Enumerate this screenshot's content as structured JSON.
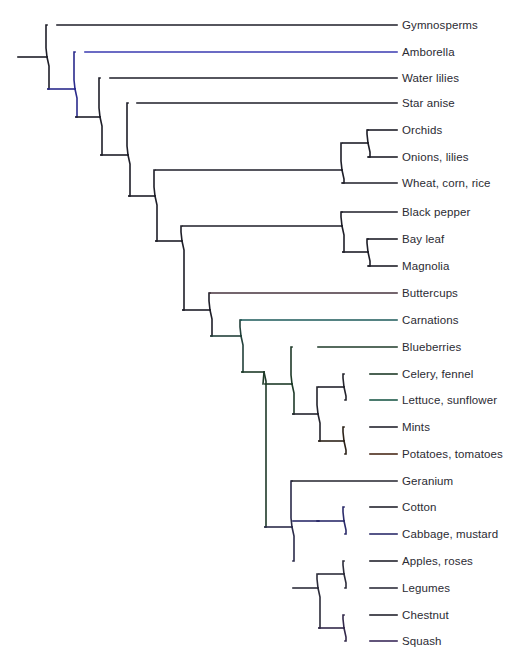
{
  "figure": {
    "name": "plant-phylogeny-cladogram",
    "type": "phylogenetic-tree",
    "background_color": "#ffffff",
    "label_color": "#2b2b33",
    "default_branch_color": "#1a1a22",
    "label_x": 402,
    "tip_x": 397,
    "root_x": 18,
    "root_y": 57
  },
  "tips": [
    {
      "id": "gymnosperms",
      "label": "Gymnosperms",
      "y": 25,
      "branch_x": 57,
      "color": "#1e1e28"
    },
    {
      "id": "amborella",
      "label": "Amborella",
      "y": 52,
      "branch_x": 85,
      "color": "#3a3ab0"
    },
    {
      "id": "water-lilies",
      "label": "Water lilies",
      "y": 78,
      "branch_x": 110,
      "color": "#1e1e28"
    },
    {
      "id": "star-anise",
      "label": "Star anise",
      "y": 103,
      "branch_x": 137,
      "color": "#1e1e28"
    },
    {
      "id": "orchids",
      "label": "Orchids",
      "y": 130,
      "branch_x": 368,
      "color": "#1e1e28"
    },
    {
      "id": "onions-lilies",
      "label": "Onions, lilies",
      "y": 157,
      "branch_x": 368,
      "color": "#1e1e28"
    },
    {
      "id": "wheat-corn-rice",
      "label": "Wheat, corn, rice",
      "y": 183,
      "branch_x": 342,
      "color": "#1e1e28"
    },
    {
      "id": "black-pepper",
      "label": "Black pepper",
      "y": 212,
      "branch_x": 342,
      "color": "#1e1e28"
    },
    {
      "id": "bay-leaf",
      "label": "Bay leaf",
      "y": 239,
      "branch_x": 368,
      "color": "#1e1e28"
    },
    {
      "id": "magnolia",
      "label": "Magnolia",
      "y": 266,
      "branch_x": 368,
      "color": "#1e1e28"
    },
    {
      "id": "buttercups",
      "label": "Buttercups",
      "y": 293,
      "branch_x": 210,
      "color": "#46323c"
    },
    {
      "id": "carnations",
      "label": "Carnations",
      "y": 320,
      "branch_x": 241,
      "color": "#1d5a5a"
    },
    {
      "id": "blueberries",
      "label": "Blueberries",
      "y": 347,
      "branch_x": 318,
      "color": "#1e3a28"
    },
    {
      "id": "celery-fennel",
      "label": "Celery, fennel",
      "y": 374,
      "branch_x": 370,
      "color": "#1e3a28"
    },
    {
      "id": "lettuce-sunflower",
      "label": "Lettuce, sunflower",
      "y": 400,
      "branch_x": 370,
      "color": "#1d5a4a"
    },
    {
      "id": "mints",
      "label": "Mints",
      "y": 427,
      "branch_x": 370,
      "color": "#23232c"
    },
    {
      "id": "potatoes-tomatoes",
      "label": "Potatoes, tomatoes",
      "y": 454,
      "branch_x": 370,
      "color": "#4a2a18"
    },
    {
      "id": "geranium",
      "label": "Geranium",
      "y": 481,
      "branch_x": 292,
      "color": "#23232c"
    },
    {
      "id": "cotton",
      "label": "Cotton",
      "y": 507,
      "branch_x": 370,
      "color": "#23232c"
    },
    {
      "id": "cabbage-mustard",
      "label": "Cabbage, mustard",
      "y": 534,
      "branch_x": 370,
      "color": "#2b2b6a"
    },
    {
      "id": "apples-roses",
      "label": "Apples, roses",
      "y": 561,
      "branch_x": 370,
      "color": "#23232c"
    },
    {
      "id": "legumes",
      "label": "Legumes",
      "y": 588,
      "branch_x": 370,
      "color": "#2c2c3a"
    },
    {
      "id": "chestnut",
      "label": "Chestnut",
      "y": 615,
      "branch_x": 370,
      "color": "#23232c"
    },
    {
      "id": "squash",
      "label": "Squash",
      "y": 641,
      "branch_x": 370,
      "color": "#3a2a5a"
    }
  ],
  "nodes": [
    {
      "id": "root",
      "x": 47,
      "y": 57,
      "child_top_y": 25,
      "child_bot_y": 89,
      "color": "#1e1e28"
    },
    {
      "id": "angiosperms",
      "x": 75,
      "y": 89,
      "child_top_y": 52,
      "child_bot_y": 117,
      "color": "#2b2b8c"
    },
    {
      "id": "mesangiosperms",
      "x": 100,
      "y": 117,
      "child_top_y": 78,
      "child_bot_y": 155,
      "color": "#1e1e28"
    },
    {
      "id": "post-starAnise",
      "x": 128,
      "y": 155,
      "child_top_y": 103,
      "child_bot_y": 196,
      "color": "#1e1e28"
    },
    {
      "id": "monocots",
      "x": 342,
      "y": 170,
      "child_top_y": 143,
      "child_bot_y": 183,
      "color": "#1e1e28"
    },
    {
      "id": "orchid-onion",
      "x": 368,
      "y": 143,
      "child_top_y": 130,
      "child_bot_y": 157,
      "color": "#1e1e28"
    },
    {
      "id": "mono-magno",
      "x": 155,
      "y": 196,
      "child_top_y": 170,
      "child_bot_y": 241,
      "color": "#1e1e28"
    },
    {
      "id": "magnoliids",
      "x": 342,
      "y": 226,
      "child_top_y": 212,
      "child_bot_y": 252,
      "color": "#1e1e28"
    },
    {
      "id": "bay-magnolia",
      "x": 368,
      "y": 252,
      "child_top_y": 239,
      "child_bot_y": 266,
      "color": "#1e1e28"
    },
    {
      "id": "eudicot-stem",
      "x": 182,
      "y": 241,
      "child_top_y": 226,
      "child_bot_y": 310,
      "color": "#1e1e28"
    },
    {
      "id": "eudicots",
      "x": 210,
      "y": 310,
      "child_top_y": 293,
      "child_bot_y": 336,
      "color": "#1e1e28"
    },
    {
      "id": "core-eudicots",
      "x": 241,
      "y": 336,
      "child_top_y": 320,
      "child_bot_y": 372,
      "color": "#22403a"
    },
    {
      "id": "aster-rosid",
      "x": 264,
      "y": 372,
      "child_top_y": 384,
      "child_bot_y": 527,
      "color": "#1e3a28"
    },
    {
      "id": "asterids",
      "x": 292,
      "y": 384,
      "child_top_y": 347,
      "child_bot_y": 414,
      "color": "#1e3a28"
    },
    {
      "id": "asterid-core",
      "x": 318,
      "y": 414,
      "child_top_y": 387,
      "child_bot_y": 441,
      "color": "#23232c"
    },
    {
      "id": "celery-lettuce",
      "x": 344,
      "y": 387,
      "child_top_y": 374,
      "child_bot_y": 400,
      "color": "#23232c"
    },
    {
      "id": "mint-potato",
      "x": 344,
      "y": 441,
      "child_top_y": 427,
      "child_bot_y": 454,
      "color": "#2c2218"
    },
    {
      "id": "rosids",
      "x": 292,
      "y": 527,
      "child_top_y": 481,
      "child_bot_y": 561,
      "color": "#2b2b4a"
    },
    {
      "id": "malvid-brassic",
      "x": 318,
      "y": 521,
      "child_top_y": 521,
      "child_bot_y": 521,
      "color": "#2b2b6a"
    },
    {
      "id": "cotton-cabbage",
      "x": 344,
      "y": 521,
      "child_top_y": 507,
      "child_bot_y": 534,
      "color": "#2b2b6a"
    },
    {
      "id": "fabids",
      "x": 318,
      "y": 588,
      "child_top_y": 574,
      "child_bot_y": 628,
      "color": "#2c2c3a"
    },
    {
      "id": "apple-legume",
      "x": 344,
      "y": 574,
      "child_top_y": 561,
      "child_bot_y": 588,
      "color": "#2c2c3a"
    },
    {
      "id": "chestnut-squash",
      "x": 344,
      "y": 628,
      "child_top_y": 615,
      "child_bot_y": 641,
      "color": "#32284a"
    }
  ],
  "clades": [
    {
      "id": "root",
      "label": "seed plants"
    },
    {
      "id": "angiosperms",
      "label": "angiosperms"
    },
    {
      "id": "monocots",
      "label": "monocots"
    },
    {
      "id": "magnoliids",
      "label": "magnoliids"
    },
    {
      "id": "eudicots",
      "label": "eudicots"
    },
    {
      "id": "asterids",
      "label": "asterids"
    },
    {
      "id": "rosids",
      "label": "rosids"
    }
  ]
}
